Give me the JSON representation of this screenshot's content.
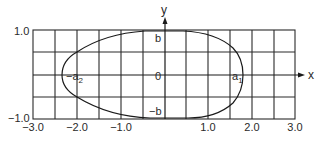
{
  "diagram": {
    "type": "closed-curve-on-grid",
    "axes": {
      "x_label": "x",
      "y_label": "y"
    },
    "x_ticks": [
      "−3.0",
      "−2.0",
      "−1.0",
      "1.0",
      "2.0",
      "3.0"
    ],
    "y_ticks": [
      "1.0",
      "−1.0"
    ],
    "annotations": {
      "origin": "0",
      "top_intercept": "b",
      "bottom_intercept": "−b",
      "left_intercept_base": "−a",
      "left_intercept_sub": "2",
      "right_intercept_base": "a",
      "right_intercept_sub": "1"
    },
    "grid": {
      "x_range": [
        -3.0,
        3.0
      ],
      "y_range": [
        -1.0,
        1.0
      ],
      "columns": 12,
      "rows": 4
    },
    "curve": {
      "left_vertex_x": -2.35,
      "right_vertex_x": 1.8,
      "top_y": 1.0,
      "bottom_y": -1.0
    },
    "colors": {
      "grid": "#2a2a2a",
      "curve": "#1a1a1a",
      "background": "#ffffff"
    }
  }
}
